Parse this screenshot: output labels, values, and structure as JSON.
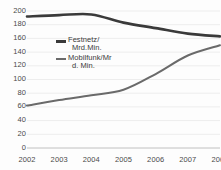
{
  "chart_data": {
    "type": "line",
    "title": "",
    "subtitle": "",
    "xlabel": "",
    "ylabel": "",
    "x": [
      2002,
      2003,
      2004,
      2005,
      2006,
      2007,
      2008
    ],
    "categories": [
      "2002",
      "2003",
      "2004",
      "2005",
      "2006",
      "2007",
      "2008"
    ],
    "ylim": [
      0,
      200
    ],
    "yticks": [
      0,
      20,
      40,
      60,
      80,
      100,
      120,
      140,
      160,
      180,
      200
    ],
    "ytick_labels": [
      "0",
      "20",
      "40",
      "60",
      "80",
      "100",
      "120",
      "140",
      "160",
      "180",
      "200"
    ],
    "grid": true,
    "grid_axis": "y",
    "legend_position": "inside-upper-left",
    "series": [
      {
        "name": "Festnetz/Mrd.Min.",
        "name_line1": "Festnetz/",
        "name_line2": "Mrd.Min.",
        "color": "#3a3a3a",
        "line_width": 2.6,
        "values": [
          192,
          194,
          195,
          183,
          175,
          167,
          163
        ]
      },
      {
        "name": "Mobilfunk/Mrd. Min.",
        "name_line1": "Mobilfunk/Mr",
        "name_line2": "d. Min.",
        "color": "#6a6a6a",
        "line_width": 2.0,
        "values": [
          62,
          70,
          77,
          85,
          108,
          135,
          150
        ]
      }
    ]
  },
  "axis": {
    "grid_color": "#ededed",
    "baseline_color": "#c8c8c8",
    "tick_text_color": "#4a4a4a"
  }
}
